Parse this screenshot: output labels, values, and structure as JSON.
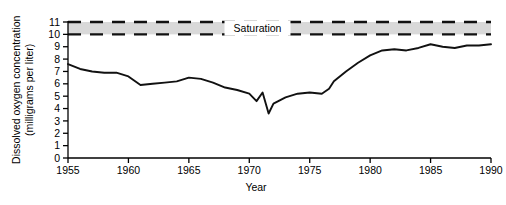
{
  "chart_data": {
    "type": "line",
    "title": "",
    "xlabel": "Year",
    "ylabel": "Dissolved oxygen concentration (milligrams per liter)",
    "ylabel_line1": "Dissolved oxygen concentration",
    "ylabel_line2": "(milligrams per liter)",
    "xlim": [
      1955,
      1990
    ],
    "ylim": [
      0,
      11
    ],
    "grid": false,
    "legend": "none",
    "xticks": [
      1955,
      1960,
      1965,
      1970,
      1975,
      1980,
      1985,
      1990
    ],
    "xtick_labels": [
      "1955",
      "1960",
      "1965",
      "1970",
      "1975",
      "1980",
      "1985",
      "1990"
    ],
    "yticks": [
      0,
      1,
      2,
      3,
      4,
      5,
      6,
      7,
      8,
      9,
      10,
      11
    ],
    "ytick_labels": [
      "0",
      "1",
      "2",
      "3",
      "4",
      "5",
      "6",
      "7",
      "8",
      "9",
      "10",
      "11"
    ],
    "xminor_interval": 1,
    "annotations": [
      {
        "name": "saturation-band",
        "label": "Saturation",
        "type": "hband",
        "y_lower": 10,
        "y_upper": 11,
        "fill": "#d9d9d9",
        "line_style": "dashed",
        "line_color": "#111111"
      }
    ],
    "series": [
      {
        "name": "Dissolved oxygen",
        "color": "#111111",
        "x": [
          1955,
          1956,
          1957,
          1958,
          1959,
          1960,
          1961,
          1962,
          1963,
          1964,
          1965,
          1966,
          1967,
          1968,
          1969,
          1970,
          1970.6,
          1971.1,
          1971.6,
          1972,
          1973,
          1974,
          1975,
          1976,
          1976.6,
          1977,
          1978,
          1979,
          1980,
          1981,
          1982,
          1983,
          1984,
          1985,
          1986,
          1987,
          1988,
          1989,
          1990
        ],
        "values": [
          7.6,
          7.2,
          7.0,
          6.9,
          6.9,
          6.6,
          5.9,
          6.0,
          6.1,
          6.2,
          6.5,
          6.4,
          6.1,
          5.7,
          5.5,
          5.2,
          4.6,
          5.3,
          3.6,
          4.4,
          4.9,
          5.2,
          5.3,
          5.2,
          5.6,
          6.2,
          7.0,
          7.7,
          8.3,
          8.7,
          8.8,
          8.7,
          8.9,
          9.2,
          9.0,
          8.9,
          9.1,
          9.1,
          9.2
        ]
      }
    ]
  },
  "axis": {
    "y_title_line1": "Dissolved oxygen concentration",
    "y_title_line2": "(milligrams per liter)",
    "x_title": "Year"
  }
}
